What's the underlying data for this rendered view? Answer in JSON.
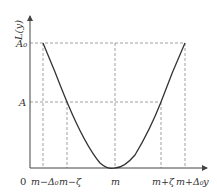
{
  "figure": {
    "type": "membership-function-diagram",
    "y_axis_label": "L(y)",
    "x_axis_label": "y",
    "origin_label": "0",
    "y_ticks": [
      {
        "label": "A₀",
        "level": "top"
      },
      {
        "label": "A",
        "level": "middle"
      }
    ],
    "x_ticks": [
      {
        "label": "m−Δ₀"
      },
      {
        "label": "m−ζ"
      },
      {
        "label": "m"
      },
      {
        "label": "m+ζ"
      },
      {
        "label": "m+Δ₀"
      }
    ],
    "curve": {
      "description": "U-shaped curve with minimum 0 at m, reaching A at m±ζ and A₀ at m±Δ₀",
      "color": "#333333"
    },
    "grid_color": "#888888"
  }
}
